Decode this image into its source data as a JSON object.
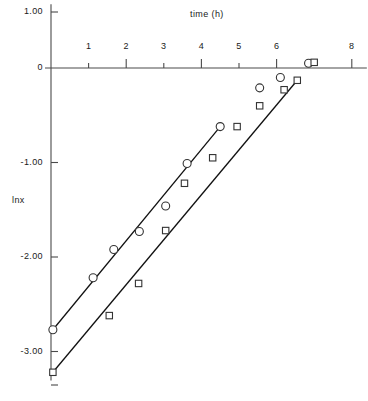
{
  "chart_data": {
    "type": "scatter",
    "title": "time (h)",
    "xlabel": "time (h)",
    "ylabel": "lnx",
    "xlim": [
      0,
      8.4
    ],
    "ylim": [
      -3.35,
      0.6
    ],
    "xticks": [
      1,
      2,
      3,
      4,
      5,
      6,
      8
    ],
    "xtick_labels": [
      "1",
      "2",
      "3",
      "4",
      "5",
      "6",
      "8"
    ],
    "yticks": [
      1.0,
      0,
      -1.0,
      -2.0,
      -3.0
    ],
    "ytick_labels": [
      "1.00",
      "0",
      "-1.00",
      "-2.00",
      "-3.00"
    ],
    "grid": false,
    "legend": "none",
    "series": [
      {
        "name": "circles",
        "marker": "circle",
        "points": [
          {
            "x": 0.05,
            "y": -2.77
          },
          {
            "x": 1.12,
            "y": -2.22
          },
          {
            "x": 1.67,
            "y": -1.92
          },
          {
            "x": 2.35,
            "y": -1.73
          },
          {
            "x": 3.05,
            "y": -1.46
          },
          {
            "x": 3.62,
            "y": -1.01
          },
          {
            "x": 4.5,
            "y": -0.62
          },
          {
            "x": 5.55,
            "y": -0.21
          },
          {
            "x": 6.1,
            "y": -0.1
          },
          {
            "x": 6.85,
            "y": 0.05
          }
        ],
        "fit_line": {
          "x1": 0.05,
          "y1": -2.77,
          "x2": 4.5,
          "y2": -0.62
        }
      },
      {
        "name": "squares",
        "marker": "square",
        "points": [
          {
            "x": 0.05,
            "y": -3.22
          },
          {
            "x": 1.55,
            "y": -2.62
          },
          {
            "x": 2.33,
            "y": -2.28
          },
          {
            "x": 3.05,
            "y": -1.72
          },
          {
            "x": 3.55,
            "y": -1.22
          },
          {
            "x": 4.3,
            "y": -0.95
          },
          {
            "x": 4.95,
            "y": -0.62
          },
          {
            "x": 5.55,
            "y": -0.4
          },
          {
            "x": 6.2,
            "y": -0.23
          },
          {
            "x": 6.55,
            "y": -0.13
          },
          {
            "x": 7.0,
            "y": 0.06
          }
        ],
        "fit_line": {
          "x1": 0.05,
          "y1": -3.22,
          "x2": 6.55,
          "y2": -0.13
        }
      }
    ],
    "colors": {
      "axis": "#4a4a4a",
      "line": "#111111",
      "marker_stroke": "#333333",
      "marker_fill": "#ffffff",
      "background": "#ffffff"
    }
  }
}
